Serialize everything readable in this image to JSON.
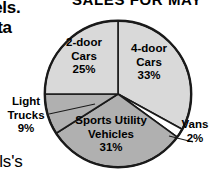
{
  "page": {
    "background_color": "#ffffff",
    "surrounding_text": {
      "top_left_fragment_1": "eels.",
      "top_left_fragment_2": "ata",
      "bottom_left_fragment": "els's"
    }
  },
  "chart_data": {
    "type": "pie",
    "title": "SALES FOR MAY",
    "xlabel": "",
    "ylabel": "",
    "legend_position": "none",
    "grid": false,
    "label_format": "name + percent",
    "categories": [
      "4-door Cars",
      "Vans",
      "Sports Utility Vehicles",
      "Light Trucks",
      "2-door Cars"
    ],
    "values": [
      33,
      2,
      31,
      9,
      25
    ],
    "units": "percent",
    "start_angle_deg": 0,
    "direction": "clockwise",
    "slices": [
      {
        "name": "4-door Cars",
        "label_line_1": "4-door",
        "label_line_2": "Cars",
        "percent_text": "33%",
        "value": 33,
        "color": "#d9d9d9",
        "label_placement": "inside",
        "leader_line": false
      },
      {
        "name": "Vans",
        "label_line_1": "Vans",
        "label_line_2": "",
        "percent_text": "2%",
        "value": 2,
        "color": "#ffffff",
        "label_placement": "outside-right",
        "leader_line": true
      },
      {
        "name": "Sports Utility Vehicles",
        "label_line_1": "Sports Utility",
        "label_line_2": "Vehicles",
        "percent_text": "31%",
        "value": 31,
        "color": "#b0b0b0",
        "label_placement": "inside",
        "leader_line": false
      },
      {
        "name": "Light Trucks",
        "label_line_1": "Light",
        "label_line_2": "Trucks",
        "percent_text": "9%",
        "value": 9,
        "color": "#b0b0b0",
        "label_placement": "outside-left",
        "leader_line": true
      },
      {
        "name": "2-door Cars",
        "label_line_1": "2-door",
        "label_line_2": "Cars",
        "percent_text": "25%",
        "value": 25,
        "color": "#d9d9d9",
        "label_placement": "inside",
        "leader_line": false
      }
    ],
    "outline_color": "#1a1a1a",
    "divider_color": "#1a1a1a",
    "total_percent": 100
  }
}
